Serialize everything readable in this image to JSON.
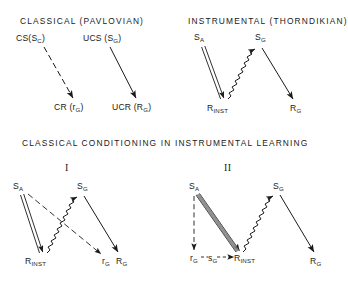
{
  "figure": {
    "panels": {
      "top_left": {
        "title": "CLASSICAL   (PAVLOVIAN)",
        "nodes": {
          "cs": "CS(S",
          "cs_sub": "C",
          "cs_close": ")",
          "ucs": "UCS (S",
          "ucs_sub": "G",
          "ucs_close": ")",
          "cr": "CR (r",
          "cr_sub": "G",
          "cr_close": ")",
          "ucr": "UCR (R",
          "ucr_sub": "G",
          "ucr_close": ")"
        }
      },
      "top_right": {
        "title": "INSTRUMENTAL   (THORNDIKIAN)",
        "nodes": {
          "sa": "S",
          "sa_sub": "A",
          "sg": "S",
          "sg_sub": "G",
          "rinst": "R",
          "rinst_sub": "INST",
          "rg": "R",
          "rg_sub": "G"
        }
      },
      "middle_title": "CLASSICAL   CONDITIONING   IN   INSTRUMENTAL   LEARNING",
      "bottom_left": {
        "numeral": "I",
        "nodes": {
          "sa": "S",
          "sa_sub": "A",
          "sg": "S",
          "sg_sub": "G",
          "rinst": "R",
          "rinst_sub": "INST",
          "rg_small": "r",
          "rg_small_sub": "G",
          "rg": "R",
          "rg_sub": "G"
        }
      },
      "bottom_right": {
        "numeral": "II",
        "nodes": {
          "sa": "S",
          "sa_sub": "A",
          "sg": "S",
          "sg_sub": "G",
          "rg_small": "r",
          "rg_small_sub": "G",
          "sg_small": "s",
          "sg_small_sub": "G",
          "rinst": "R",
          "rinst_sub": "INST",
          "rg": "R",
          "rg_sub": "G"
        }
      }
    },
    "caption_partial": "",
    "colors": {
      "ink": "#1a1a1a",
      "background": "#ffffff"
    }
  }
}
